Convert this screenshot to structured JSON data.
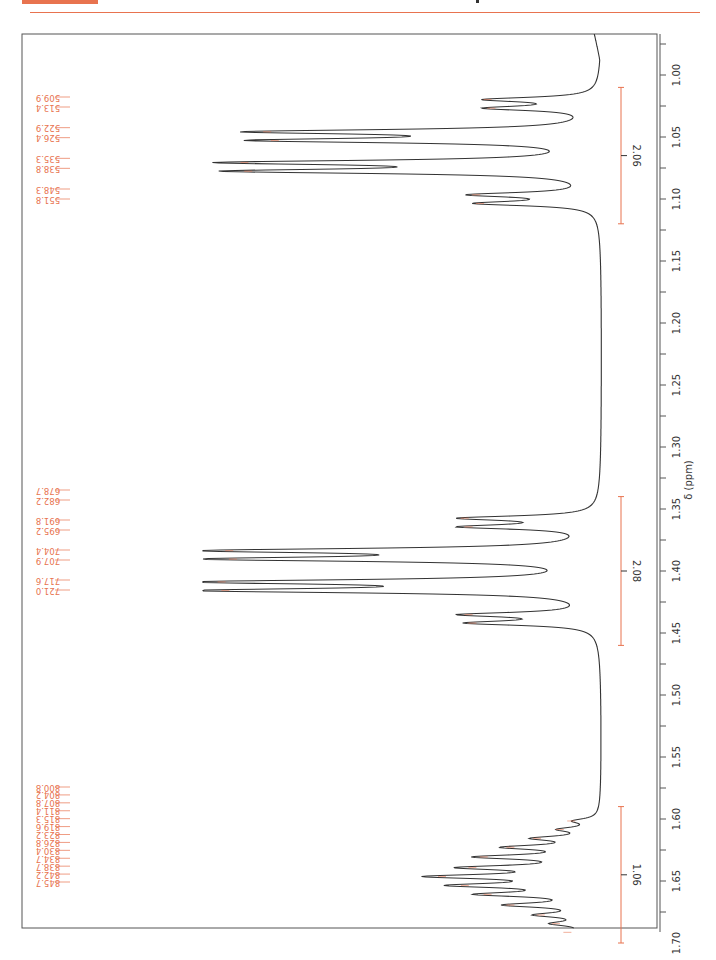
{
  "page": {
    "accent_color": "#e8734f",
    "spectrum_color": "#333333",
    "integral_color": "#e8734f"
  },
  "chart_data": {
    "type": "line",
    "title": "",
    "xlabel": "δ (ppm)",
    "ylabel": "",
    "orientation": "rotated-90",
    "xlim": [
      0.97,
      1.72
    ],
    "grid": false,
    "ticks": [
      "1.00",
      "1.05",
      "1.10",
      "1.15",
      "1.20",
      "1.25",
      "1.30",
      "1.35",
      "1.40",
      "1.45",
      "1.50",
      "1.55",
      "1.60",
      "1.65",
      "1.70"
    ],
    "tick_values": [
      1.0,
      1.05,
      1.1,
      1.15,
      1.2,
      1.25,
      1.3,
      1.35,
      1.4,
      1.45,
      1.5,
      1.55,
      1.6,
      1.65,
      1.7
    ],
    "peak_labels_hz": [
      {
        "group": 1,
        "labels": [
          "509.9",
          "513.4",
          "522.9",
          "526.4",
          "535.3",
          "538.8",
          "548.3",
          "551.8"
        ]
      },
      {
        "group": 2,
        "labels": [
          "678.7",
          "682.2",
          "691.8",
          "695.2",
          "704.4",
          "707.9",
          "717.6",
          "721.0"
        ]
      },
      {
        "group": 3,
        "labels": [
          "800.8",
          "804.2",
          "807.8",
          "811.4",
          "815.3",
          "819.6",
          "823.2",
          "826.8",
          "830.4",
          "834.7",
          "838.7",
          "842.2",
          "845.7"
        ]
      }
    ],
    "peaks": [
      {
        "ppm": 1.0198,
        "height": 0.28
      },
      {
        "ppm": 1.0268,
        "height": 0.27
      },
      {
        "ppm": 1.0458,
        "height": 0.86
      },
      {
        "ppm": 1.0528,
        "height": 0.84
      },
      {
        "ppm": 1.0706,
        "height": 0.92
      },
      {
        "ppm": 1.0776,
        "height": 0.91
      },
      {
        "ppm": 1.0966,
        "height": 0.31
      },
      {
        "ppm": 1.1036,
        "height": 0.3
      },
      {
        "ppm": 1.3574,
        "height": 0.34
      },
      {
        "ppm": 1.3644,
        "height": 0.33
      },
      {
        "ppm": 1.3836,
        "height": 0.96
      },
      {
        "ppm": 1.3904,
        "height": 0.95
      },
      {
        "ppm": 1.4088,
        "height": 0.98
      },
      {
        "ppm": 1.4158,
        "height": 0.97
      },
      {
        "ppm": 1.4352,
        "height": 0.33
      },
      {
        "ppm": 1.442,
        "height": 0.32
      },
      {
        "ppm": 1.6016,
        "height": 0.06
      },
      {
        "ppm": 1.6084,
        "height": 0.09
      },
      {
        "ppm": 1.6156,
        "height": 0.15
      },
      {
        "ppm": 1.6228,
        "height": 0.22
      },
      {
        "ppm": 1.6306,
        "height": 0.29
      },
      {
        "ppm": 1.6392,
        "height": 0.32
      },
      {
        "ppm": 1.6464,
        "height": 0.4
      },
      {
        "ppm": 1.6536,
        "height": 0.34
      },
      {
        "ppm": 1.6608,
        "height": 0.28
      },
      {
        "ppm": 1.6694,
        "height": 0.22
      },
      {
        "ppm": 1.6774,
        "height": 0.14
      },
      {
        "ppm": 1.6844,
        "height": 0.1
      },
      {
        "ppm": 1.6914,
        "height": 0.07
      }
    ],
    "integrals": [
      {
        "from": 1.01,
        "to": 1.12,
        "value": "2.06"
      },
      {
        "from": 1.34,
        "to": 1.46,
        "value": "2.08"
      },
      {
        "from": 1.59,
        "to": 1.7,
        "value": "1.06"
      }
    ]
  }
}
